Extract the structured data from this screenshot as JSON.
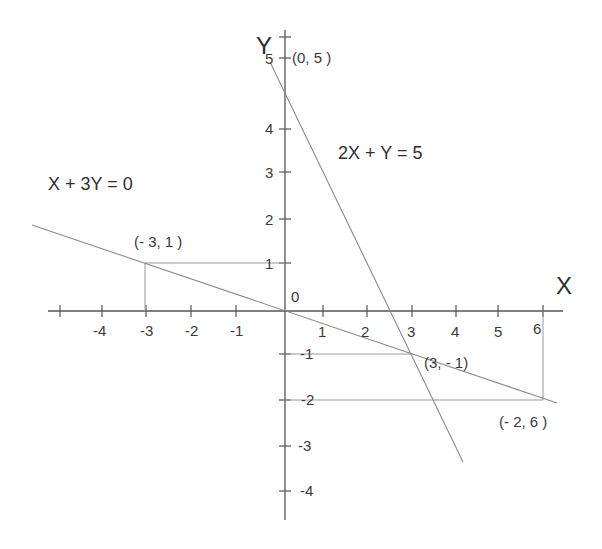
{
  "diagram": {
    "axes": {
      "x_label": "X",
      "y_label": "Y",
      "origin_label": "0",
      "x_ticks": [
        "-4",
        "-3",
        "-2",
        "-1",
        "1",
        "2",
        "3",
        "4",
        "5",
        "6"
      ],
      "y_ticks": [
        "5",
        "4",
        "3",
        "2",
        "1",
        "-1",
        "-2",
        "-3",
        "-4"
      ]
    },
    "equations": {
      "line1": "X + 3Y = 0",
      "line2": "2X + Y = 5"
    },
    "points": {
      "p1": "(0, 5 )",
      "p2": "(- 3, 1 )",
      "p3": "(3, - 1)",
      "p4": "(- 2, 6 )"
    },
    "colors": {
      "axis": "#555555",
      "line": "#8a8a8a",
      "guide": "#999999",
      "text": "#333333"
    }
  }
}
